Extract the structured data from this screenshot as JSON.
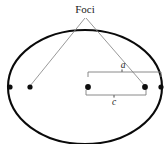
{
  "figure": {
    "title_label": "Foci",
    "labels": {
      "semi_major": "a",
      "focal_distance": "c"
    },
    "colors": {
      "ellipse_stroke": "#0a0a0a",
      "leader_stroke": "#8d8d8d",
      "brace_stroke": "#7e7e7e",
      "point_fill": "#0d0d0d",
      "background": "#ffffff",
      "text": "#1a1a1a"
    },
    "geometry": {
      "ellipse_center": [
        85,
        87
      ],
      "ellipse_rx": 77,
      "ellipse_ry": 57,
      "left_vertex": [
        10,
        87
      ],
      "right_vertex": [
        161,
        87
      ],
      "center_point": [
        88,
        87
      ],
      "left_focus": [
        30,
        87
      ],
      "right_focus": [
        145,
        87
      ],
      "leader_apex": [
        85,
        17
      ],
      "semi_major_brace": {
        "from_x": 88,
        "to_x": 161,
        "y": 71
      },
      "focal_brace": {
        "from_x": 86,
        "to_x": 146,
        "y": 95
      }
    },
    "points": [
      {
        "name": "left-vertex-point",
        "cx": 10,
        "cy": 87,
        "r": 2.6
      },
      {
        "name": "left-focus-point",
        "cx": 30,
        "cy": 87,
        "r": 2.6
      },
      {
        "name": "center-point",
        "cx": 88,
        "cy": 87,
        "r": 2.9
      },
      {
        "name": "right-focus-point",
        "cx": 145,
        "cy": 87,
        "r": 2.9
      },
      {
        "name": "right-vertex-point",
        "cx": 161,
        "cy": 87,
        "r": 2.6
      }
    ]
  }
}
